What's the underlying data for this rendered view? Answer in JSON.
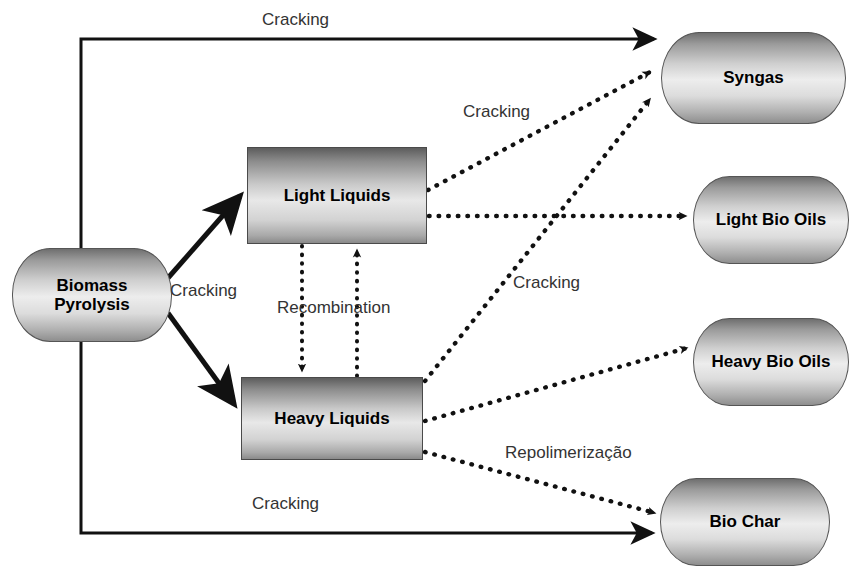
{
  "diagram": {
    "nodes": [
      {
        "id": "biomass",
        "label": "Biomass\nPyrolysis",
        "shape": "cylinder",
        "x": 12,
        "y": 248,
        "w": 160,
        "h": 94
      },
      {
        "id": "light-liquids",
        "label": "Light Liquids",
        "shape": "rectangle",
        "x": 247,
        "y": 147,
        "w": 180,
        "h": 97
      },
      {
        "id": "heavy-liquids",
        "label": "Heavy Liquids",
        "shape": "rectangle",
        "x": 241,
        "y": 377,
        "w": 182,
        "h": 83
      },
      {
        "id": "syngas",
        "label": "Syngas",
        "shape": "cylinder",
        "x": 661,
        "y": 32,
        "w": 185,
        "h": 92
      },
      {
        "id": "light-bio",
        "label": "Light Bio Oils",
        "shape": "cylinder",
        "x": 693,
        "y": 176,
        "w": 156,
        "h": 88
      },
      {
        "id": "heavy-bio",
        "label": "Heavy Bio Oils",
        "shape": "cylinder",
        "x": 693,
        "y": 318,
        "w": 156,
        "h": 88
      },
      {
        "id": "bio-char",
        "label": "Bio Char",
        "shape": "cylinder",
        "x": 660,
        "y": 478,
        "w": 170,
        "h": 88
      }
    ],
    "edge_labels": [
      {
        "id": "cracking-top",
        "text": "Cracking",
        "x": 262,
        "y": 10
      },
      {
        "id": "cracking-split",
        "text": "Cracking",
        "x": 170,
        "y": 281
      },
      {
        "id": "cracking-upper-mid",
        "text": "Cracking",
        "x": 463,
        "y": 102
      },
      {
        "id": "cracking-lower-mid",
        "text": "Cracking",
        "x": 513,
        "y": 273
      },
      {
        "id": "cracking-bottom",
        "text": "Cracking",
        "x": 252,
        "y": 494
      },
      {
        "id": "recombination",
        "text": "Recombination",
        "x": 277,
        "y": 298
      },
      {
        "id": "repolimerizacao",
        "text": "Repolimerização",
        "x": 505,
        "y": 443
      }
    ],
    "colors": {
      "stroke": "#1a1a1a",
      "node_border": "#4a4a4a",
      "label_text": "#333333",
      "background": "#ffffff"
    }
  }
}
